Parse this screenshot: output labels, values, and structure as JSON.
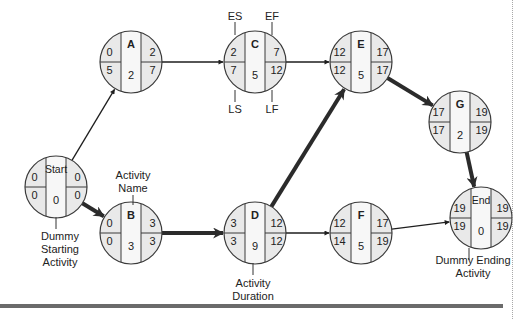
{
  "diagram": {
    "type": "activity-on-node network (critical path)",
    "colors": {
      "node_fill_side": "#e9e9e9",
      "node_fill_center": "#f7f7f7",
      "node_stroke": "#3a3a3a",
      "arrow": "#1e1e1e",
      "critical_arrow": "#2b2b2b",
      "text": "#222222",
      "bottom_rule": "#6b6b6b"
    },
    "nodes": [
      {
        "id": "start",
        "name": "Start",
        "es": "0",
        "ef": "0",
        "ls": "0",
        "lf": "0",
        "duration": "0",
        "cx": 56,
        "cy": 187,
        "bold": false
      },
      {
        "id": "a",
        "name": "A",
        "es": "0",
        "ef": "2",
        "ls": "5",
        "lf": "7",
        "duration": "2",
        "cx": 131,
        "cy": 62,
        "bold": true
      },
      {
        "id": "b",
        "name": "B",
        "es": "0",
        "ef": "3",
        "ls": "0",
        "lf": "3",
        "duration": "3",
        "cx": 131,
        "cy": 233,
        "bold": true
      },
      {
        "id": "c",
        "name": "C",
        "es": "2",
        "ef": "7",
        "ls": "7",
        "lf": "12",
        "duration": "5",
        "cx": 255,
        "cy": 62,
        "bold": true
      },
      {
        "id": "d",
        "name": "D",
        "es": "3",
        "ef": "12",
        "ls": "3",
        "lf": "12",
        "duration": "9",
        "cx": 255,
        "cy": 233,
        "bold": true
      },
      {
        "id": "e",
        "name": "E",
        "es": "12",
        "ef": "17",
        "ls": "12",
        "lf": "17",
        "duration": "5",
        "cx": 361,
        "cy": 62,
        "bold": true
      },
      {
        "id": "f",
        "name": "F",
        "es": "12",
        "ef": "17",
        "ls": "14",
        "lf": "19",
        "duration": "5",
        "cx": 361,
        "cy": 233,
        "bold": true
      },
      {
        "id": "g",
        "name": "G",
        "es": "17",
        "ef": "19",
        "ls": "17",
        "lf": "19",
        "duration": "2",
        "cx": 460,
        "cy": 122,
        "bold": true
      },
      {
        "id": "end",
        "name": "End",
        "es": "19",
        "ef": "19",
        "ls": "19",
        "lf": "19",
        "duration": "0",
        "cx": 481,
        "cy": 218,
        "bold": false
      }
    ],
    "edges": [
      {
        "from": "start",
        "to": "a",
        "critical": false
      },
      {
        "from": "start",
        "to": "b",
        "critical": true
      },
      {
        "from": "a",
        "to": "c",
        "critical": false
      },
      {
        "from": "b",
        "to": "d",
        "critical": true
      },
      {
        "from": "c",
        "to": "e",
        "critical": false
      },
      {
        "from": "d",
        "to": "e",
        "critical": true
      },
      {
        "from": "d",
        "to": "f",
        "critical": false
      },
      {
        "from": "e",
        "to": "g",
        "critical": true
      },
      {
        "from": "f",
        "to": "end",
        "critical": false
      },
      {
        "from": "g",
        "to": "end",
        "critical": true
      }
    ],
    "annotations": {
      "es": "ES",
      "ef": "EF",
      "ls": "LS",
      "lf": "LF",
      "activity_name_line1": "Activity",
      "activity_name_line2": "Name",
      "activity_duration_line1": "Activity",
      "activity_duration_line2": "Duration",
      "dummy_start_line1": "Dummy",
      "dummy_start_line2": "Starting",
      "dummy_start_line3": "Activity",
      "dummy_end_line1": "Dummy Ending",
      "dummy_end_line2": "Activity"
    }
  }
}
